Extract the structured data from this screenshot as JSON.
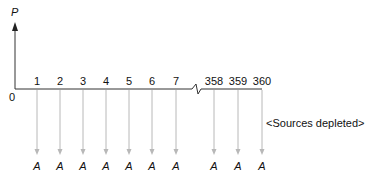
{
  "diagram": {
    "y_axis_label": "P",
    "origin_label": "0",
    "periods": [
      {
        "label": "1",
        "x": 37,
        "flow": "A"
      },
      {
        "label": "2",
        "x": 60,
        "flow": "A"
      },
      {
        "label": "3",
        "x": 83,
        "flow": "A"
      },
      {
        "label": "4",
        "x": 106,
        "flow": "A"
      },
      {
        "label": "5",
        "x": 129,
        "flow": "A"
      },
      {
        "label": "6",
        "x": 152,
        "flow": "A"
      },
      {
        "label": "7",
        "x": 176,
        "flow": "A"
      },
      {
        "label": "358",
        "x": 214,
        "flow": "A"
      },
      {
        "label": "359",
        "x": 238,
        "flow": "A"
      },
      {
        "label": "360",
        "x": 262,
        "flow": "A"
      }
    ],
    "note": "<Sources depleted>",
    "axis_color": "#333333",
    "arrow_color": "#b8b8b8"
  }
}
